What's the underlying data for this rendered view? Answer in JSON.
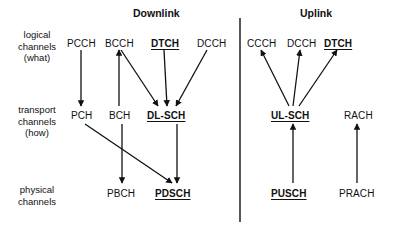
{
  "diagram": {
    "titles": {
      "downlink": "Downlink",
      "uplink": "Uplink"
    },
    "row_labels": [
      {
        "line1": "logical",
        "line2": "channels",
        "line3": "(what)"
      },
      {
        "line1": "transport",
        "line2": "channels",
        "line3": "(how)"
      },
      {
        "line1": "physical",
        "line2": "channels",
        "line3": ""
      }
    ],
    "layers": {
      "logical": {
        "downlink": [
          {
            "id": "pcch",
            "label": "PCCH",
            "bold": false
          },
          {
            "id": "bcch",
            "label": "BCCH",
            "bold": false
          },
          {
            "id": "dtch-dl",
            "label": "DTCH",
            "bold": true
          },
          {
            "id": "dcch-dl",
            "label": "DCCH",
            "bold": false
          }
        ],
        "uplink": [
          {
            "id": "ccch-ul",
            "label": "CCCH",
            "bold": false
          },
          {
            "id": "dcch-ul",
            "label": "DCCH",
            "bold": false
          },
          {
            "id": "dtch-ul",
            "label": "DTCH",
            "bold": true
          }
        ]
      },
      "transport": {
        "downlink": [
          {
            "id": "pch",
            "label": "PCH",
            "bold": false
          },
          {
            "id": "bch",
            "label": "BCH",
            "bold": false
          },
          {
            "id": "dl-sch",
            "label": "DL-SCH",
            "bold": true
          }
        ],
        "uplink": [
          {
            "id": "ul-sch",
            "label": "UL-SCH",
            "bold": true
          },
          {
            "id": "rach",
            "label": "RACH",
            "bold": false
          }
        ]
      },
      "physical": {
        "downlink": [
          {
            "id": "pbch",
            "label": "PBCH",
            "bold": false
          },
          {
            "id": "pdsch",
            "label": "PDSCH",
            "bold": true
          }
        ],
        "uplink": [
          {
            "id": "pusch",
            "label": "PUSCH",
            "bold": true
          },
          {
            "id": "prach",
            "label": "PRACH",
            "bold": false
          }
        ]
      }
    },
    "connections": [
      {
        "from": "pcch",
        "to": "pch",
        "direction": "down"
      },
      {
        "from": "bch",
        "to": "bcch",
        "direction": "up"
      },
      {
        "from": "bcch",
        "to": "dl-sch",
        "direction": "down"
      },
      {
        "from": "dtch-dl",
        "to": "dl-sch",
        "direction": "down"
      },
      {
        "from": "dcch-dl",
        "to": "dl-sch",
        "direction": "down"
      },
      {
        "from": "pch",
        "to": "pdsch",
        "direction": "down"
      },
      {
        "from": "bch",
        "to": "pbch",
        "direction": "down"
      },
      {
        "from": "dl-sch",
        "to": "pdsch",
        "direction": "down"
      },
      {
        "from": "ul-sch",
        "to": "ccch-ul",
        "direction": "up"
      },
      {
        "from": "ul-sch",
        "to": "dcch-ul",
        "direction": "up"
      },
      {
        "from": "ul-sch",
        "to": "dtch-ul",
        "direction": "up"
      },
      {
        "from": "pusch",
        "to": "ul-sch",
        "direction": "up"
      },
      {
        "from": "prach",
        "to": "rach",
        "direction": "up"
      }
    ],
    "colors": {
      "line": "#111111",
      "text": "#111111",
      "background": "#ffffff",
      "divider": "#111111"
    }
  }
}
